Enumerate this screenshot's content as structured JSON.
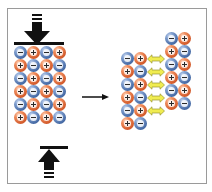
{
  "diagram": {
    "colors": {
      "negative_ion": "#3f64a0",
      "positive_ion": "#cf5526",
      "repulsion_arrow": "#f0ec50",
      "repulsion_arrow_outline": "#9a9530",
      "force_arrow": "#111111",
      "frame_border": "#9a9a9a"
    },
    "left_lattice": {
      "label": "before stress",
      "rows": [
        [
          "-",
          "+",
          "-",
          "+"
        ],
        [
          "+",
          "-",
          "+",
          "-"
        ],
        [
          "-",
          "+",
          "-",
          "+"
        ],
        [
          "+",
          "-",
          "+",
          "-"
        ],
        [
          "-",
          "+",
          "-",
          "+"
        ],
        [
          "+",
          "-",
          "+",
          "-"
        ]
      ]
    },
    "right_lattice": {
      "label": "after shift",
      "left_block": [
        [
          "-",
          "+"
        ],
        [
          "+",
          "-"
        ],
        [
          "-",
          "+"
        ],
        [
          "+",
          "-"
        ],
        [
          "-",
          "+"
        ],
        [
          "+",
          "-"
        ]
      ],
      "right_block": [
        [
          "-",
          "+"
        ],
        [
          "+",
          "-"
        ],
        [
          "-",
          "+"
        ],
        [
          "+",
          "-"
        ],
        [
          "-",
          "+"
        ],
        [
          "+",
          "-"
        ]
      ],
      "repulsion_arrows": 5
    },
    "icons": {
      "top_force": "down-arrow-icon",
      "bottom_force": "up-arrow-icon",
      "transition": "right-arrow-icon",
      "repulsion": "double-headed-arrow-icon"
    }
  }
}
